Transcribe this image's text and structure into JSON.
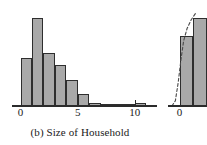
{
  "figure": {
    "caption": "(b) Size of Household",
    "background_color": "#ffffff",
    "bar_fill_color": "#a9a9a9",
    "bar_edge_color": "#2e2e2e",
    "axis_color": "#2b2b2b",
    "text_color": "#1a1a1a"
  },
  "chart_data": [
    {
      "type": "bar",
      "title": "(b) Size of Household",
      "subtitle": "",
      "xlabel": "",
      "ylabel": "",
      "orientation": "vertical",
      "histogram": true,
      "bin_width": 1,
      "grid": false,
      "legend": null,
      "xlim": [
        -0.4,
        11.5
      ],
      "ylim": [
        0,
        100
      ],
      "xticks": [
        0,
        5,
        10
      ],
      "xticklabels": [
        "0",
        "5",
        "10"
      ],
      "yticks": [],
      "yticklabels": [],
      "bins": [
        {
          "x0": 0,
          "x1": 1,
          "value": 55
        },
        {
          "x0": 1,
          "x1": 2,
          "value": 100
        },
        {
          "x0": 2,
          "x1": 3,
          "value": 60
        },
        {
          "x0": 3,
          "x1": 4,
          "value": 47
        },
        {
          "x0": 4,
          "x1": 5,
          "value": 30
        },
        {
          "x0": 5,
          "x1": 6,
          "value": 14
        },
        {
          "x0": 6,
          "x1": 7,
          "value": 3
        },
        {
          "x0": 7,
          "x1": 8,
          "value": 1
        },
        {
          "x0": 8,
          "x1": 9,
          "value": 1
        },
        {
          "x0": 9,
          "x1": 10,
          "value": 1
        },
        {
          "x0": 10,
          "x1": 11,
          "value": 3
        }
      ],
      "categories": [
        "0-1",
        "1-2",
        "2-3",
        "3-4",
        "4-5",
        "5-6",
        "6-7",
        "7-8",
        "8-9",
        "9-10",
        "10-11"
      ],
      "values": [
        55,
        100,
        60,
        47,
        30,
        14,
        3,
        1,
        1,
        1,
        3
      ]
    },
    {
      "type": "bar",
      "title": "",
      "clipped": true,
      "note": "adjacent panel, only left edge visible",
      "xlabel": "",
      "ylabel": "",
      "grid": false,
      "xlim": [
        -1.2,
        2.0
      ],
      "ylim": [
        0,
        100
      ],
      "xticks": [
        0
      ],
      "xticklabels": [
        "0"
      ],
      "yticks": [],
      "yticklabels": [],
      "bins": [
        {
          "x0": 0,
          "x1": 1,
          "value": 80
        },
        {
          "x0": 1,
          "x1": 2,
          "value": 100
        }
      ],
      "categories": [
        "0-1",
        "1-2"
      ],
      "values": [
        80,
        100
      ],
      "overlay_curve": {
        "style": "dashed",
        "points": [
          {
            "x": -0.55,
            "y": 0
          },
          {
            "x": -0.3,
            "y": 6
          },
          {
            "x": -0.1,
            "y": 26
          },
          {
            "x": 0.1,
            "y": 52
          },
          {
            "x": 0.3,
            "y": 74
          },
          {
            "x": 0.55,
            "y": 88
          },
          {
            "x": 0.85,
            "y": 98
          },
          {
            "x": 1.2,
            "y": 106
          }
        ]
      }
    }
  ],
  "main_panel": {
    "name": "size-of-household-histogram",
    "axis_ticks": [
      {
        "label": "0",
        "value": 0
      },
      {
        "label": "5",
        "value": 5
      },
      {
        "label": "10",
        "value": 10
      }
    ]
  },
  "right_panel": {
    "name": "adjacent-clipped-histogram",
    "axis_ticks": [
      {
        "label": "0",
        "value": 0
      }
    ]
  }
}
